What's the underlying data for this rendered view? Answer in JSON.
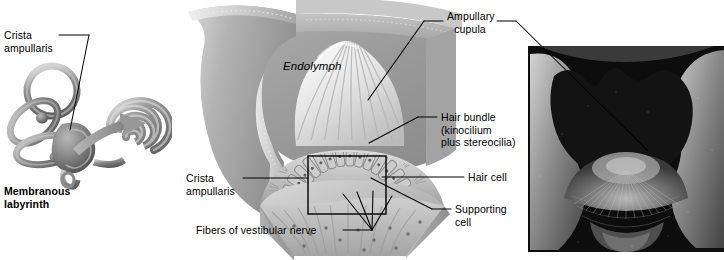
{
  "figure": {
    "background_color": "#ffffff",
    "text_color": "#000000"
  },
  "panels": {
    "left": {
      "name": "membranous-labyrinth-diagram"
    },
    "center": {
      "name": "ampulla-cutaway-illustration"
    },
    "right": {
      "name": "scanning-electron-micrograph"
    }
  },
  "labels": {
    "crista_ampullaris_top": "Crista\nampullaris",
    "membranous_labyrinth": "Membranous\nlabyrinth",
    "endolymph": "Endolymph",
    "ampullary_cupula": "Ampullary\ncupula",
    "hair_bundle": "Hair bundle\n(kinocilium\nplus stereocilia)",
    "hair_cell": "Hair cell",
    "supporting_cell": "Supporting\ncell",
    "crista_ampullaris_mid": "Crista\nampullaris",
    "fibers_of_vestibular_nerve": "Fibers of vestibular nerve"
  },
  "colors": {
    "leader_line": "#000000",
    "labyrinth_gray": "#8f8f8f",
    "arrow_gray": "#9a9a9a",
    "endolymph_gray": "#9b9b9b",
    "ampulla_wall": "#bdbdbd",
    "cupula_light": "#ebebeb",
    "crista_tissue": "#c6c6c6",
    "sem_dark": "#0d0d0d",
    "sem_mid": "#6d6d6d",
    "sem_light": "#cfcfcf"
  }
}
